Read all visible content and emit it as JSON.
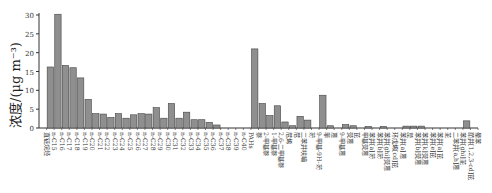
{
  "chart_data": {
    "type": "bar",
    "title": "",
    "xlabel": "",
    "ylabel": "浓度/(μg m⁻³)",
    "ylim": [
      0,
      30
    ],
    "yticks": [
      0,
      5,
      10,
      15,
      20,
      25,
      30
    ],
    "grid": false,
    "bar_color": "#8f8f8f",
    "categories": [
      "直链烷烃",
      "n-C15",
      "n-C16",
      "n-C17",
      "n-C18",
      "n-C19",
      "n-C20",
      "n-C21",
      "n-C22",
      "n-C23",
      "n-C24",
      "n-C25",
      "n-C26",
      "n-C27",
      "n-C28",
      "n-C29",
      "n-C30",
      "n-C31",
      "n-C32",
      "n-C33",
      "n-C34",
      "n-C35",
      "n-C36",
      "n-C37",
      "n-C38",
      "n-C39",
      "n-C40",
      "PAHs",
      "萘",
      "2-甲基萘",
      "1-甲基萘",
      "2,6-二甲基萘",
      "苊烯",
      "苊",
      "二苯并呋喃",
      "芴",
      "9-甲基-9H-芴",
      "菲",
      "蒽",
      "9-甲基蒽",
      "荧蒽",
      "芘",
      "甲基荧蒽",
      "苯并[a]芴",
      "苯并[b]芴",
      "苯并[ghi]荧蒽",
      "环戊烯[cd]芘",
      "苯并[a]蒽",
      "䓛",
      "苯并[b]荧蒽",
      "苯并[k]荧蒽",
      "苯并[e]芘",
      "苯并[a]芘",
      "苝",
      "二苯并[a,h]蒽",
      "苯并[ghi]苝",
      "茚并[1,2,3-cd]芘",
      "晕苯"
    ],
    "values": [
      0,
      16.2,
      30.2,
      16.6,
      16.0,
      13.3,
      7.6,
      3.8,
      3.7,
      2.8,
      3.8,
      2.6,
      3.5,
      3.8,
      3.7,
      5.4,
      2.6,
      6.5,
      2.6,
      4.2,
      2.2,
      2.2,
      1.5,
      0.8,
      0,
      0,
      0,
      0,
      21.0,
      6.5,
      3.3,
      5.9,
      1.6,
      0.6,
      3.1,
      2.1,
      0,
      8.7,
      0.6,
      0,
      0.9,
      0.6,
      0,
      0.4,
      0,
      0.4,
      0,
      0,
      0.5,
      0.5,
      0.5,
      0,
      0,
      0,
      0,
      0,
      1.9,
      0
    ]
  }
}
